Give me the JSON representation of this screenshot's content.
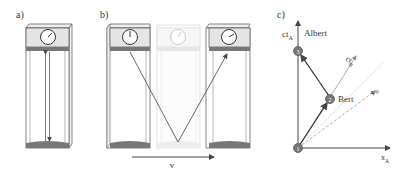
{
  "panels": {
    "a": {
      "label": "a)"
    },
    "b": {
      "label": "b)",
      "velocity_label": "v"
    },
    "c": {
      "label": "c)",
      "axis_ct_a": {
        "main": "ct",
        "sub": "A"
      },
      "axis_x_a": {
        "main": "x",
        "sub": "A"
      },
      "axis_ct_b": {
        "main": "ct",
        "sub": "B"
      },
      "axis_x_b": {
        "main": "x",
        "sub": "B"
      },
      "observer_albert": "Albert",
      "observer_bert": "Bert",
      "events": [
        {
          "id": "1",
          "label": "1"
        },
        {
          "id": "2",
          "label": "2"
        },
        {
          "id": "3",
          "label": "3"
        }
      ]
    }
  },
  "colors": {
    "line": "#555555",
    "frame": "#666666",
    "clock_bg": "#e4e4e4",
    "band": "#777777",
    "ghost": "#cccccc",
    "node": "#777777",
    "light_line": "#d4d4d4"
  }
}
